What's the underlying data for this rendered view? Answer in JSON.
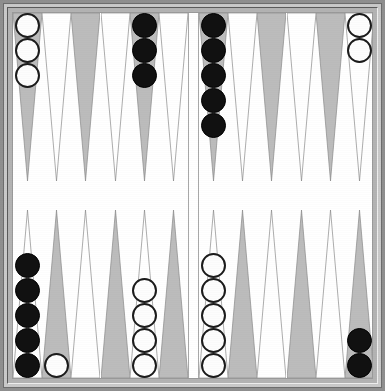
{
  "app": {
    "title": "Backgammon Board",
    "game_type": "backgammon"
  },
  "board": {
    "width": 385,
    "height": 391,
    "frame_color": "#b3b3b3",
    "frame_outer_color": "#8f8f8f",
    "field_color": "#ffffff",
    "point_dark_color": "#bcbcbc",
    "point_light_color": "#ffffff",
    "point_outline_color": "#8a8a8a",
    "checker_white_color": "#fdfdfd",
    "checker_white_outline": "#1b1b1b",
    "checker_black_color": "#111111",
    "bar_color": "#ffffff",
    "point_count": 24,
    "points_per_quadrant": 6
  },
  "quadrants": {
    "top_left": {
      "name": "top-left-quadrant",
      "points": [
        {
          "index": 1,
          "fill": "dark",
          "checkers": {
            "color": "white",
            "count": 3
          }
        },
        {
          "index": 2,
          "fill": "light",
          "checkers": {
            "color": "none",
            "count": 0
          }
        },
        {
          "index": 3,
          "fill": "dark",
          "checkers": {
            "color": "none",
            "count": 0
          }
        },
        {
          "index": 4,
          "fill": "light",
          "checkers": {
            "color": "none",
            "count": 0
          }
        },
        {
          "index": 5,
          "fill": "dark",
          "checkers": {
            "color": "black",
            "count": 3
          }
        },
        {
          "index": 6,
          "fill": "light",
          "checkers": {
            "color": "none",
            "count": 0
          }
        }
      ]
    },
    "top_right": {
      "name": "top-right-quadrant",
      "points": [
        {
          "index": 1,
          "fill": "dark",
          "checkers": {
            "color": "black",
            "count": 5
          }
        },
        {
          "index": 2,
          "fill": "light",
          "checkers": {
            "color": "none",
            "count": 0
          }
        },
        {
          "index": 3,
          "fill": "dark",
          "checkers": {
            "color": "none",
            "count": 0
          }
        },
        {
          "index": 4,
          "fill": "light",
          "checkers": {
            "color": "none",
            "count": 0
          }
        },
        {
          "index": 5,
          "fill": "dark",
          "checkers": {
            "color": "none",
            "count": 0
          }
        },
        {
          "index": 6,
          "fill": "light",
          "checkers": {
            "color": "white",
            "count": 2
          }
        }
      ]
    },
    "bottom_left": {
      "name": "bottom-left-quadrant",
      "points": [
        {
          "index": 1,
          "fill": "light",
          "checkers": {
            "color": "black",
            "count": 5
          }
        },
        {
          "index": 2,
          "fill": "dark",
          "checkers": {
            "color": "white",
            "count": 1
          }
        },
        {
          "index": 3,
          "fill": "light",
          "checkers": {
            "color": "none",
            "count": 0
          }
        },
        {
          "index": 4,
          "fill": "dark",
          "checkers": {
            "color": "none",
            "count": 0
          }
        },
        {
          "index": 5,
          "fill": "light",
          "checkers": {
            "color": "white",
            "count": 4
          }
        },
        {
          "index": 6,
          "fill": "dark",
          "checkers": {
            "color": "none",
            "count": 0
          }
        }
      ]
    },
    "bottom_right": {
      "name": "bottom-right-quadrant",
      "points": [
        {
          "index": 1,
          "fill": "light",
          "checkers": {
            "color": "white",
            "count": 5
          }
        },
        {
          "index": 2,
          "fill": "dark",
          "checkers": {
            "color": "none",
            "count": 0
          }
        },
        {
          "index": 3,
          "fill": "light",
          "checkers": {
            "color": "none",
            "count": 0
          }
        },
        {
          "index": 4,
          "fill": "dark",
          "checkers": {
            "color": "none",
            "count": 0
          }
        },
        {
          "index": 5,
          "fill": "light",
          "checkers": {
            "color": "none",
            "count": 0
          }
        },
        {
          "index": 6,
          "fill": "dark",
          "checkers": {
            "color": "black",
            "count": 2
          }
        }
      ]
    }
  },
  "checker_totals": {
    "white": 15,
    "black": 15
  }
}
